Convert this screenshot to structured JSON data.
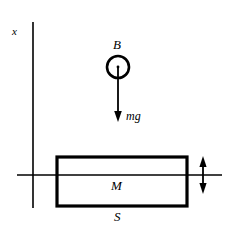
{
  "figure": {
    "background_color": "#ffffff",
    "stroke_color": "#000000",
    "labels": {
      "axis_vertical": "x",
      "bob": "B",
      "weight_force": "mg",
      "block_mass": "M",
      "surface": "S"
    },
    "geometry": {
      "axis_vertical_x": 33,
      "axis_vertical_top": 22,
      "axis_vertical_bottom": 208,
      "axis_horizontal_y": 175,
      "axis_horizontal_left": 17,
      "axis_horizontal_right": 222,
      "circle_center_x": 118,
      "circle_center_y": 67,
      "circle_radius": 11,
      "force_arrow_top": 67,
      "force_arrow_bottom": 121,
      "block_left": 57,
      "block_right": 187,
      "block_top": 157,
      "block_bottom": 206,
      "block_stroke_width": 3,
      "motion_arrow_x": 203,
      "motion_arrow_top": 157,
      "motion_arrow_bottom": 193
    }
  }
}
